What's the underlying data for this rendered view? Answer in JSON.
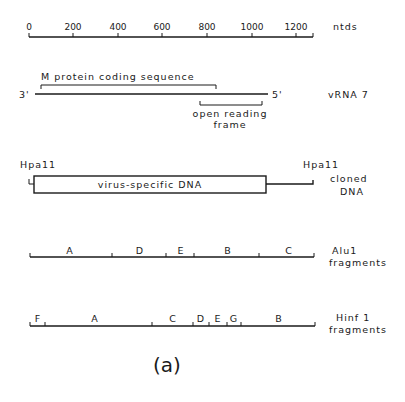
{
  "scale": {
    "unit_label": "ntds",
    "ticks": [
      {
        "label": "0",
        "value": 0
      },
      {
        "label": "200",
        "value": 200
      },
      {
        "label": "400",
        "value": 400
      },
      {
        "label": "600",
        "value": 600
      },
      {
        "label": "800",
        "value": 800
      },
      {
        "label": "1000",
        "value": 1000
      },
      {
        "label": "1200",
        "value": 1200
      }
    ],
    "end_value": 1280
  },
  "vrna": {
    "label": "vRNA 7",
    "left_end": "3'",
    "right_end": "5'",
    "m_protein_label": "M protein coding sequence",
    "orf_label_line1": "open reading",
    "orf_label_line2": "frame"
  },
  "cloned": {
    "left_site": "Hpa11",
    "right_site": "Hpa11",
    "insert_label": "virus-specific DNA",
    "label_line1": "cloned",
    "label_line2": "DNA"
  },
  "alu": {
    "label_line1": "Alu1",
    "label_line2": "fragments",
    "fragments": [
      "A",
      "D",
      "E",
      "B",
      "C"
    ]
  },
  "hinf": {
    "label_line1": "Hinf 1",
    "label_line2": "fragments",
    "fragments": [
      "F",
      "A",
      "C",
      "D",
      "E",
      "G",
      "B"
    ]
  },
  "panel_label": "(a)"
}
